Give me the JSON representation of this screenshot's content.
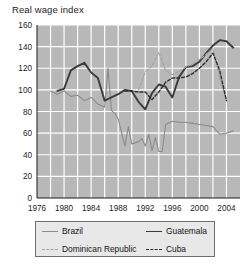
{
  "chart": {
    "title": "Real wage index",
    "panel_bg": "#b8b8b8",
    "grid_color": "#ffffff",
    "axis_color": "#1d1d1d"
  },
  "legend": {
    "entries": [
      {
        "label": "Brazil",
        "style": "solid",
        "color": "#8b8b8b",
        "name": "legend-item-brazil"
      },
      {
        "label": "Guatemala",
        "style": "solid",
        "color": "#3b3b3b",
        "name": "legend-item-guatemala"
      },
      {
        "label": "Dominican Republic",
        "style": "dashed",
        "color": "#a5a5a5",
        "name": "legend-item-dominican-republic"
      },
      {
        "label": "Cuba",
        "style": "dashed",
        "color": "#2f2f2f",
        "name": "legend-item-cuba"
      }
    ]
  },
  "chart_data": {
    "type": "line",
    "title": "Real wage index",
    "xlabel": "",
    "ylabel": "Real wage index",
    "xlim": [
      1976,
      2006
    ],
    "ylim": [
      0,
      160
    ],
    "yticks": [
      0,
      20,
      40,
      60,
      80,
      100,
      120,
      140,
      160
    ],
    "ytick_labels": [
      "0",
      "20",
      "40",
      "60",
      "80",
      "100",
      "120",
      "140",
      "160"
    ],
    "xticks": [
      1976,
      1980,
      1984,
      1988,
      1992,
      1996,
      2000,
      2004
    ],
    "xtick_labels": [
      "1976",
      "1980",
      "1984",
      "1988",
      "1992",
      "1996",
      "2000",
      "2004"
    ],
    "grid": true,
    "grid_axes": "both",
    "legend_position": "below",
    "series": [
      {
        "name": "Brazil",
        "color": "#8b8b8b",
        "style": "solid",
        "width": 1.1,
        "x": [
          1978,
          1979,
          1980,
          1981,
          1982,
          1983,
          1984,
          1985,
          1986,
          1986.5,
          1987,
          1987.5,
          1988,
          1989,
          1989.5,
          1990,
          1990.5,
          1991,
          1991.5,
          1992,
          1992.5,
          1993,
          1993.5,
          1994,
          1994.5,
          1995,
          1996,
          1997,
          1998,
          1999,
          2000,
          2001,
          2002,
          2003,
          2004,
          2005
        ],
        "y": [
          99,
          96,
          99,
          94,
          95,
          90,
          93,
          87,
          84,
          120,
          81,
          78,
          73,
          48,
          66,
          50,
          51,
          52,
          55,
          48,
          59,
          44,
          56,
          43,
          43,
          68,
          71,
          70,
          70,
          69,
          68,
          67,
          66,
          59,
          60,
          62
        ]
      },
      {
        "name": "Guatemala",
        "color": "#3b3b3b",
        "style": "solid",
        "width": 1.9,
        "x": [
          1979,
          1980,
          1981,
          1982,
          1983,
          1984,
          1985,
          1986,
          1987,
          1988,
          1989,
          1990,
          1991,
          1992,
          1993,
          1994,
          1995,
          1996,
          1997,
          1998,
          1999,
          2000,
          2001,
          2002,
          2003,
          2004,
          2005
        ],
        "y": [
          99,
          101,
          118,
          122,
          125,
          116,
          111,
          90,
          93,
          96,
          100,
          99,
          89,
          82,
          97,
          105,
          103,
          93,
          112,
          121,
          122,
          126,
          134,
          141,
          146,
          145,
          139
        ]
      },
      {
        "name": "Dominican Republic",
        "color": "#a5a5a5",
        "style": "dashed",
        "width": 1.2,
        "x": [
          1991,
          1992,
          1993,
          1994,
          1995,
          1996,
          1997,
          1998,
          1999,
          2000,
          2001,
          2002,
          2003,
          2004
        ],
        "y": [
          100,
          117,
          122,
          135,
          118,
          114,
          117,
          121,
          124,
          128,
          133,
          138,
          112,
          90
        ]
      },
      {
        "name": "Cuba",
        "color": "#2f2f2f",
        "style": "dashed",
        "width": 1.4,
        "x": [
          1989,
          1990,
          1991,
          1992,
          1993,
          1994,
          1995,
          1996,
          1997,
          1998,
          1999,
          2000,
          2001,
          2002,
          2003,
          2004
        ],
        "y": [
          99,
          99,
          98,
          98,
          91,
          98,
          107,
          111,
          111,
          112,
          115,
          120,
          126,
          134,
          118,
          90
        ]
      }
    ]
  }
}
